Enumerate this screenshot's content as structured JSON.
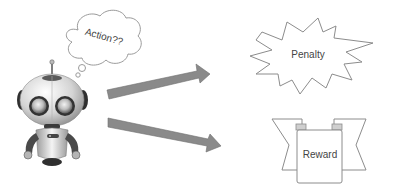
{
  "diagram": {
    "thought_bubble": {
      "text": "Action??"
    },
    "agent": {
      "label": "robot"
    },
    "arrows": [
      {
        "id": "to-penalty",
        "direction": "up-right"
      },
      {
        "id": "to-reward",
        "direction": "down-right"
      }
    ],
    "outcomes": {
      "penalty": {
        "text": "Penalty",
        "shape": "starburst"
      },
      "reward": {
        "text": "Reward",
        "shape": "banner"
      }
    }
  },
  "colors": {
    "arrow_fill": "#8a8a8a",
    "arrow_stroke": "#6e6e6e",
    "outline": "#8c8c8c",
    "text": "#444444",
    "robot_body": "#d9d9d9",
    "robot_dark": "#3a3a3a"
  }
}
